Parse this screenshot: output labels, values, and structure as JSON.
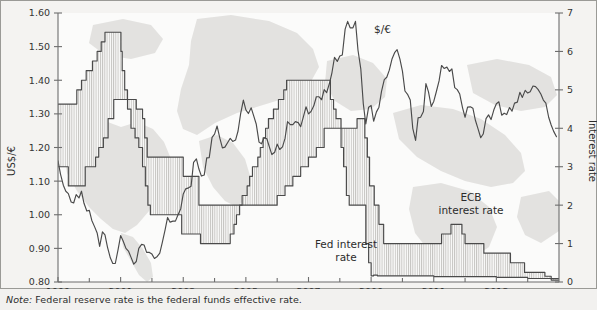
{
  "figure": {
    "note_label": "Note:",
    "note_body": " Federal reserve rate is the federal funds effective rate.",
    "background_color": "#f4f3f1",
    "line_color": "#4a4a4a",
    "map_watermark_color": "#e2e1df"
  },
  "annotations": {
    "exchange_rate": "$/€",
    "fed_rate_line1": "Fed interest",
    "fed_rate_line2": "rate",
    "ecb_rate_line1": "ECB",
    "ecb_rate_line2": "interest rate"
  },
  "chart_data": {
    "type": "line",
    "title": "",
    "subtitle": "",
    "xlabel": "",
    "ylabel": "US$/€",
    "y2label": "Interest rate",
    "grid": false,
    "legend_position": "inline-annotations",
    "xlim": [
      1999.0,
      2015.0
    ],
    "ylim": [
      0.8,
      1.6
    ],
    "y2lim": [
      0,
      7
    ],
    "xticks_major": [
      1999,
      2001,
      2003,
      2005,
      2007,
      2009,
      2011,
      2013
    ],
    "xticks_minor": [
      2000,
      2002,
      2004,
      2006,
      2008,
      2010,
      2012,
      2014
    ],
    "xtick_labels": [
      "1999",
      "2001",
      "2003",
      "2005",
      "2007",
      "2009",
      "2011",
      "2013"
    ],
    "yticks": [
      0.8,
      0.9,
      1.0,
      1.1,
      1.2,
      1.3,
      1.4,
      1.5,
      1.6
    ],
    "ytick_labels": [
      "0.80",
      "0.90",
      "1.00",
      "1.10",
      "1.20",
      "1.30",
      "1.40",
      "1.50",
      "1.60"
    ],
    "y2ticks": [
      0,
      1,
      2,
      3,
      4,
      5,
      6,
      7
    ],
    "y2tick_labels": [
      "0",
      "1",
      "2",
      "3",
      "4",
      "5",
      "6",
      "7"
    ],
    "series": [
      {
        "name": "$/€",
        "axis": "left",
        "label": "$/€",
        "x": [
          1999.0,
          1999.08,
          1999.17,
          1999.25,
          1999.33,
          1999.42,
          1999.5,
          1999.58,
          1999.67,
          1999.75,
          1999.83,
          1999.92,
          2000.0,
          2000.08,
          2000.17,
          2000.25,
          2000.33,
          2000.42,
          2000.5,
          2000.58,
          2000.67,
          2000.75,
          2000.83,
          2000.92,
          2001.0,
          2001.08,
          2001.17,
          2001.25,
          2001.33,
          2001.42,
          2001.5,
          2001.58,
          2001.67,
          2001.75,
          2001.83,
          2001.92,
          2002.0,
          2002.08,
          2002.17,
          2002.25,
          2002.33,
          2002.42,
          2002.5,
          2002.58,
          2002.67,
          2002.75,
          2002.83,
          2002.92,
          2003.0,
          2003.08,
          2003.17,
          2003.25,
          2003.33,
          2003.42,
          2003.5,
          2003.58,
          2003.67,
          2003.75,
          2003.83,
          2003.92,
          2004.0,
          2004.08,
          2004.17,
          2004.25,
          2004.33,
          2004.42,
          2004.5,
          2004.58,
          2004.67,
          2004.75,
          2004.83,
          2004.92,
          2005.0,
          2005.08,
          2005.17,
          2005.25,
          2005.33,
          2005.42,
          2005.5,
          2005.58,
          2005.67,
          2005.75,
          2005.83,
          2005.92,
          2006.0,
          2006.08,
          2006.17,
          2006.25,
          2006.33,
          2006.42,
          2006.5,
          2006.58,
          2006.67,
          2006.75,
          2006.83,
          2006.92,
          2007.0,
          2007.08,
          2007.17,
          2007.25,
          2007.33,
          2007.42,
          2007.5,
          2007.58,
          2007.67,
          2007.75,
          2007.83,
          2007.92,
          2008.0,
          2008.08,
          2008.17,
          2008.25,
          2008.33,
          2008.42,
          2008.5,
          2008.58,
          2008.67,
          2008.75,
          2008.83,
          2008.92,
          2009.0,
          2009.08,
          2009.17,
          2009.25,
          2009.33,
          2009.42,
          2009.5,
          2009.58,
          2009.67,
          2009.75,
          2009.83,
          2009.92,
          2010.0,
          2010.08,
          2010.17,
          2010.25,
          2010.33,
          2010.42,
          2010.5,
          2010.58,
          2010.67,
          2010.75,
          2010.83,
          2010.92,
          2011.0,
          2011.08,
          2011.17,
          2011.25,
          2011.33,
          2011.42,
          2011.5,
          2011.58,
          2011.67,
          2011.75,
          2011.83,
          2011.92,
          2012.0,
          2012.08,
          2012.17,
          2012.25,
          2012.33,
          2012.42,
          2012.5,
          2012.58,
          2012.67,
          2012.75,
          2012.83,
          2012.92,
          2013.0,
          2013.08,
          2013.17,
          2013.25,
          2013.33,
          2013.42,
          2013.5,
          2013.58,
          2013.67,
          2013.75,
          2013.83,
          2013.92,
          2014.0,
          2014.08,
          2014.17,
          2014.25,
          2014.33,
          2014.42,
          2014.5,
          2014.58,
          2014.67,
          2014.75,
          2014.83,
          2014.92
        ],
        "y": [
          1.16,
          1.121,
          1.088,
          1.07,
          1.063,
          1.038,
          1.035,
          1.06,
          1.05,
          1.07,
          1.034,
          1.011,
          1.013,
          0.983,
          0.964,
          0.946,
          0.906,
          0.949,
          0.94,
          0.904,
          0.872,
          0.855,
          0.855,
          0.897,
          0.938,
          0.922,
          0.9,
          0.892,
          0.874,
          0.853,
          0.861,
          0.9,
          0.912,
          0.91,
          0.888,
          0.888,
          0.883,
          0.87,
          0.876,
          0.886,
          0.917,
          0.955,
          0.992,
          0.978,
          0.981,
          0.981,
          0.999,
          1.018,
          1.062,
          1.077,
          1.08,
          1.085,
          1.156,
          1.166,
          1.136,
          1.115,
          1.118,
          1.169,
          1.17,
          1.23,
          1.24,
          1.264,
          1.227,
          1.199,
          1.201,
          1.215,
          1.227,
          1.218,
          1.222,
          1.249,
          1.299,
          1.341,
          1.312,
          1.301,
          1.318,
          1.294,
          1.27,
          1.216,
          1.211,
          1.229,
          1.226,
          1.202,
          1.179,
          1.186,
          1.21,
          1.194,
          1.202,
          1.227,
          1.277,
          1.268,
          1.268,
          1.277,
          1.274,
          1.262,
          1.289,
          1.321,
          1.3,
          1.307,
          1.324,
          1.351,
          1.351,
          1.342,
          1.372,
          1.363,
          1.391,
          1.423,
          1.468,
          1.456,
          1.472,
          1.475,
          1.552,
          1.575,
          1.556,
          1.556,
          1.575,
          1.49,
          1.434,
          1.33,
          1.27,
          1.32,
          1.325,
          1.278,
          1.306,
          1.32,
          1.366,
          1.402,
          1.409,
          1.43,
          1.464,
          1.482,
          1.491,
          1.463,
          1.427,
          1.368,
          1.357,
          1.341,
          1.257,
          1.221,
          1.288,
          1.29,
          1.307,
          1.39,
          1.366,
          1.322,
          1.337,
          1.365,
          1.398,
          1.444,
          1.435,
          1.439,
          1.426,
          1.434,
          1.378,
          1.372,
          1.359,
          1.318,
          1.29,
          1.32,
          1.321,
          1.317,
          1.281,
          1.254,
          1.229,
          1.24,
          1.286,
          1.297,
          1.283,
          1.312,
          1.33,
          1.336,
          1.296,
          1.302,
          1.298,
          1.319,
          1.308,
          1.332,
          1.335,
          1.364,
          1.349,
          1.37,
          1.362,
          1.366,
          1.383,
          1.381,
          1.373,
          1.359,
          1.341,
          1.332,
          1.29,
          1.267,
          1.248,
          1.232
        ]
      },
      {
        "name": "Fed interest rate",
        "axis": "right",
        "label": "Fed interest rate",
        "x": [
          1999.0,
          1999.5,
          1999.6,
          1999.75,
          1999.9,
          2000.1,
          2000.25,
          2000.38,
          2000.5,
          2000.99,
          2001.01,
          2001.05,
          2001.13,
          2001.22,
          2001.33,
          2001.46,
          2001.58,
          2001.7,
          2001.79,
          2001.87,
          2001.95,
          2002.85,
          2002.95,
          2003.5,
          2003.55,
          2004.45,
          2004.5,
          2004.62,
          2004.7,
          2004.8,
          2004.88,
          2004.96,
          2005.04,
          2005.12,
          2005.21,
          2005.3,
          2005.38,
          2005.46,
          2005.55,
          2005.63,
          2005.72,
          2005.8,
          2005.88,
          2005.96,
          2006.04,
          2006.12,
          2006.21,
          2006.3,
          2006.38,
          2006.46,
          2007.62,
          2007.7,
          2007.8,
          2007.88,
          2007.96,
          2008.04,
          2008.12,
          2008.21,
          2008.3,
          2008.38,
          2008.75,
          2008.83,
          2008.92,
          2009.0,
          2009.08,
          2009.2,
          2010.0,
          2011.0,
          2012.0,
          2013.0,
          2014.0,
          2014.99
        ],
        "y": [
          4.63,
          4.63,
          5.0,
          5.25,
          5.5,
          5.75,
          6.0,
          6.25,
          6.5,
          6.5,
          6.0,
          5.5,
          5.0,
          4.5,
          4.0,
          3.75,
          3.5,
          3.0,
          2.5,
          2.0,
          1.75,
          1.75,
          1.25,
          1.25,
          1.0,
          1.0,
          1.25,
          1.5,
          1.75,
          2.0,
          2.25,
          2.25,
          2.5,
          2.75,
          3.0,
          3.0,
          3.25,
          3.5,
          3.75,
          4.0,
          4.25,
          4.25,
          4.5,
          4.5,
          4.75,
          4.75,
          5.0,
          5.25,
          5.25,
          5.25,
          5.25,
          4.75,
          4.5,
          4.25,
          4.25,
          3.5,
          3.0,
          2.25,
          2.0,
          2.0,
          2.0,
          1.0,
          0.5,
          0.16,
          0.18,
          0.16,
          0.16,
          0.14,
          0.14,
          0.12,
          0.09,
          0.09
        ]
      },
      {
        "name": "ECB interest rate",
        "axis": "right",
        "label": "ECB interest rate",
        "x": [
          1999.0,
          1999.3,
          1999.33,
          1999.83,
          1999.87,
          2000.1,
          2000.2,
          2000.3,
          2000.45,
          2000.6,
          2000.78,
          2001.42,
          2001.5,
          2001.7,
          2001.77,
          2001.85,
          2002.95,
          2003.0,
          2003.45,
          2003.5,
          2005.95,
          2006.0,
          2006.2,
          2006.25,
          2006.45,
          2006.5,
          2006.7,
          2006.75,
          2006.95,
          2007.0,
          2007.2,
          2007.25,
          2007.45,
          2007.5,
          2008.5,
          2008.55,
          2008.78,
          2008.8,
          2008.88,
          2008.95,
          2009.05,
          2009.1,
          2009.2,
          2009.25,
          2009.35,
          2009.4,
          2010.0,
          2011.2,
          2011.25,
          2011.5,
          2011.55,
          2011.85,
          2011.9,
          2011.95,
          2012.0,
          2012.55,
          2012.6,
          2013.4,
          2013.45,
          2013.85,
          2013.9,
          2014.5,
          2014.55,
          2014.7,
          2014.75,
          2014.99
        ],
        "y": [
          3.0,
          3.0,
          2.5,
          2.5,
          3.0,
          3.0,
          3.25,
          3.5,
          3.75,
          4.25,
          4.75,
          4.75,
          4.5,
          4.25,
          3.75,
          3.25,
          3.25,
          2.75,
          2.75,
          2.0,
          2.0,
          2.25,
          2.25,
          2.5,
          2.5,
          2.75,
          2.75,
          3.0,
          3.0,
          3.25,
          3.25,
          3.5,
          3.5,
          4.0,
          4.0,
          4.25,
          4.25,
          3.75,
          3.25,
          2.5,
          2.5,
          2.0,
          2.0,
          1.5,
          1.5,
          1.0,
          1.0,
          1.0,
          1.25,
          1.25,
          1.5,
          1.5,
          1.25,
          1.25,
          1.0,
          1.0,
          0.75,
          0.75,
          0.5,
          0.5,
          0.25,
          0.25,
          0.15,
          0.15,
          0.05,
          0.05
        ]
      }
    ]
  }
}
